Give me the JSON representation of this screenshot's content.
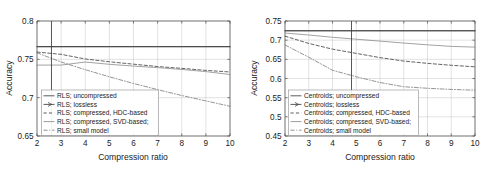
{
  "figure": {
    "background_color": "#ffffff",
    "panel_count": 2
  },
  "chart_data": [
    {
      "type": "line",
      "panel": "left",
      "title": "",
      "xlabel": "Compression ratio",
      "ylabel": "Accuracy",
      "xlim": [
        2,
        10
      ],
      "ylim": [
        0.65,
        0.8
      ],
      "xticks": [
        2,
        3,
        4,
        5,
        6,
        7,
        8,
        9,
        10
      ],
      "xticklabels": [
        "2",
        "3",
        "4",
        "5",
        "6",
        "7",
        "8",
        "9",
        "10"
      ],
      "yticks": [
        0.65,
        0.7,
        0.75,
        0.8
      ],
      "yticklabels": [
        "0.65",
        "0.7",
        "0.75",
        "0.8"
      ],
      "grid": true,
      "legend_position": "lower left",
      "annotations": [
        {
          "type": "vertical-line",
          "x": 2.6,
          "color": "#3a3a3a"
        }
      ],
      "x": [
        2,
        3,
        4,
        5,
        6,
        7,
        8,
        9,
        10
      ],
      "series": [
        {
          "name": "RLS; uncompressed",
          "linestyle": "solid",
          "color": "#3d3d3d",
          "values": [
            0.7665,
            0.7665,
            0.7665,
            0.7665,
            0.7665,
            0.7665,
            0.7665,
            0.7665,
            0.7665
          ]
        },
        {
          "name": "RLS; lossless",
          "linestyle": "solid-arrow",
          "color": "#3d3d3d",
          "values": [
            0.7665,
            0.7665,
            0.7665,
            0.7665,
            0.7665,
            0.7665,
            0.7665,
            0.7665,
            0.7665
          ]
        },
        {
          "name": "RLS; compressed, HDC-based",
          "linestyle": "dashed",
          "color": "#3d3d3d",
          "values": [
            0.7595,
            0.7565,
            0.7505,
            0.7468,
            0.7437,
            0.7406,
            0.7382,
            0.7356,
            0.7335
          ]
        },
        {
          "name": "RLS; compressed, SVD-based;",
          "linestyle": "solid",
          "color": "#8a8a8a",
          "values": [
            0.7425,
            0.7425,
            0.7465,
            0.7435,
            0.7412,
            0.7392,
            0.7368,
            0.734,
            0.7302
          ]
        },
        {
          "name": "RLS; small model",
          "linestyle": "dashdot",
          "color": "#7a7a7a",
          "values": [
            0.7585,
            0.7465,
            0.7365,
            0.7272,
            0.7185,
            0.7105,
            0.7028,
            0.6958,
            0.6888
          ]
        }
      ]
    },
    {
      "type": "line",
      "panel": "right",
      "title": "",
      "xlabel": "Compression ratio",
      "ylabel": "Accuracy",
      "xlim": [
        2,
        10
      ],
      "ylim": [
        0.45,
        0.75
      ],
      "xticks": [
        2,
        3,
        4,
        5,
        6,
        7,
        8,
        9,
        10
      ],
      "xticklabels": [
        "2",
        "3",
        "4",
        "5",
        "6",
        "7",
        "8",
        "9",
        "10"
      ],
      "yticks": [
        0.45,
        0.5,
        0.55,
        0.6,
        0.65,
        0.7,
        0.75
      ],
      "yticklabels": [
        "0.45",
        "0.5",
        "0.55",
        "0.6",
        "0.65",
        "0.7",
        "0.75"
      ],
      "grid": true,
      "legend_position": "lower left",
      "annotations": [
        {
          "type": "vertical-line",
          "x": 4.8,
          "color": "#3a3a3a"
        }
      ],
      "x": [
        2,
        3,
        4,
        5,
        6,
        7,
        8,
        9,
        10
      ],
      "series": [
        {
          "name": "Centroids; uncompressed",
          "linestyle": "solid",
          "color": "#3d3d3d",
          "values": [
            0.7245,
            0.7245,
            0.7245,
            0.7245,
            0.7245,
            0.7245,
            0.7245,
            0.7245,
            0.7245
          ]
        },
        {
          "name": "Centroids; lossless",
          "linestyle": "solid-arrow",
          "color": "#3d3d3d",
          "values": [
            0.7245,
            0.7245,
            0.7245,
            0.7245,
            0.7245,
            0.7245,
            0.7245,
            0.7245,
            0.7245
          ]
        },
        {
          "name": "Centroids; compressed, HDC-based",
          "linestyle": "dashed",
          "color": "#3d3d3d",
          "values": [
            0.7105,
            0.6915,
            0.6765,
            0.6655,
            0.6545,
            0.6455,
            0.6395,
            0.6345,
            0.6305
          ]
        },
        {
          "name": "Centroids; compressed, SVD-based;",
          "linestyle": "solid",
          "color": "#8a8a8a",
          "values": [
            0.7185,
            0.7135,
            0.7075,
            0.7025,
            0.6975,
            0.6925,
            0.6878,
            0.6838,
            0.6818
          ]
        },
        {
          "name": "Centroids; small model",
          "linestyle": "dashdot",
          "color": "#7a7a7a",
          "values": [
            0.6875,
            0.6555,
            0.6215,
            0.6045,
            0.5895,
            0.5785,
            0.5745,
            0.5715,
            0.5695
          ]
        }
      ]
    }
  ]
}
